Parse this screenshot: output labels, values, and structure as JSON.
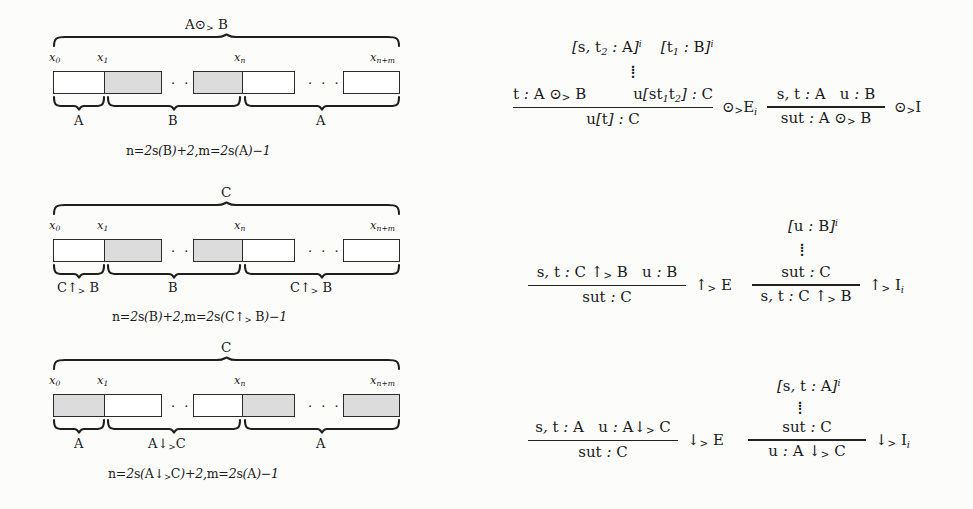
{
  "figure": {
    "kind": "string-diagrams-and-inference-rules",
    "rows": [
      {
        "id": "row-odot",
        "diagram": {
          "top_label": "A ⊙> B",
          "endpoint_labels": [
            "x0",
            "x1",
            "xn",
            "xn+m"
          ],
          "cells": [
            {
              "fill": "white"
            },
            {
              "fill": "shaded"
            },
            {
              "fill": "shaded"
            },
            {
              "fill": "white"
            },
            {
              "fill": "white"
            }
          ],
          "ellipsis": [
            "· · ·",
            "· · ·"
          ],
          "bottom_braces": [
            {
              "label": "A"
            },
            {
              "label": "B"
            },
            {
              "label": "A"
            }
          ],
          "caption": "n=2s(B)+2,m=2s(A)−1"
        },
        "rules": [
          {
            "id": "odot-elim",
            "discharge": "[s, t2 : A]i   [t1 : B]i",
            "numerator_left": "t : A ⊙> B",
            "numerator_right": "u[st1t2] : C",
            "denominator": "u[t] : C",
            "name": "⊙> Ei"
          },
          {
            "id": "odot-intro",
            "numerator": "s, t : A   u : B",
            "denominator": "sut : A ⊙> B",
            "name": "⊙> I"
          }
        ]
      },
      {
        "id": "row-uparrow",
        "diagram": {
          "top_label": "C",
          "endpoint_labels": [
            "x0",
            "x1",
            "xn",
            "xn+m"
          ],
          "cells": [
            {
              "fill": "white"
            },
            {
              "fill": "shaded"
            },
            {
              "fill": "shaded"
            },
            {
              "fill": "white"
            },
            {
              "fill": "white"
            }
          ],
          "ellipsis": [
            "· · ·",
            "· · ·"
          ],
          "bottom_braces": [
            {
              "label": "C↑> B"
            },
            {
              "label": "B"
            },
            {
              "label": "C↑> B"
            }
          ],
          "caption": "n=2s(B)+2,m=2s(C↑> B)−1"
        },
        "rules": [
          {
            "id": "uparrow-elim",
            "numerator": "s, t : C ↑> B   u : B",
            "denominator": "sut : C",
            "name": "↑> E"
          },
          {
            "id": "uparrow-intro",
            "discharge": "[u : B]i",
            "numerator": "sut : C",
            "denominator": "s, t : C ↑> B",
            "name": "↑> Ii"
          }
        ]
      },
      {
        "id": "row-downarrow",
        "diagram": {
          "top_label": "C",
          "endpoint_labels": [
            "x0",
            "x1",
            "xn",
            "xn+m"
          ],
          "cells": [
            {
              "fill": "shaded"
            },
            {
              "fill": "white"
            },
            {
              "fill": "white"
            },
            {
              "fill": "shaded"
            },
            {
              "fill": "shaded"
            }
          ],
          "ellipsis": [
            "· · ·",
            "· · ·"
          ],
          "bottom_braces": [
            {
              "label": "A"
            },
            {
              "label": "A↓> C"
            },
            {
              "label": "A"
            }
          ],
          "caption": "n=2s(A↓> C)+2,m=2s(A)−1"
        },
        "rules": [
          {
            "id": "downarrow-elim",
            "numerator": "s, t : A   u : A↓> C",
            "denominator": "sut : C",
            "name": "↓> E"
          },
          {
            "id": "downarrow-intro",
            "discharge": "[s, t : A]i",
            "numerator": "sut : C",
            "denominator": "u : A ↓> C",
            "name": "↓> Ii"
          }
        ]
      }
    ],
    "colors": {
      "ink": "#1a1a1a",
      "shade": "#dcdcdc",
      "paper": "#fcfcfb",
      "stroke": "#2b2b2b"
    }
  }
}
